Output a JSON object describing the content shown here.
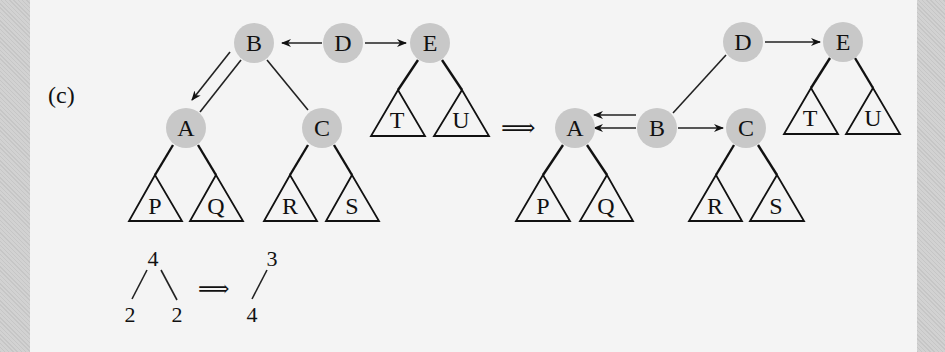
{
  "figure": {
    "panel_label": "(c)",
    "transform_arrow": "⟹",
    "before_tree": {
      "nodes": [
        {
          "id": "B",
          "label": "B"
        },
        {
          "id": "D",
          "label": "D"
        },
        {
          "id": "E",
          "label": "E"
        },
        {
          "id": "A",
          "label": "A"
        },
        {
          "id": "C",
          "label": "C"
        }
      ],
      "subtrees": [
        "P",
        "Q",
        "R",
        "S",
        "T",
        "U"
      ],
      "pointer_arrows": [
        {
          "from": "D",
          "to": "B"
        },
        {
          "from": "D",
          "to": "E"
        },
        {
          "from": "B",
          "to": "A"
        }
      ],
      "edges": [
        {
          "from": "B",
          "to": "A"
        },
        {
          "from": "B",
          "to": "C"
        },
        {
          "from": "A",
          "to": "P"
        },
        {
          "from": "A",
          "to": "Q"
        },
        {
          "from": "C",
          "to": "R"
        },
        {
          "from": "C",
          "to": "S"
        },
        {
          "from": "E",
          "to": "T"
        },
        {
          "from": "E",
          "to": "U"
        }
      ]
    },
    "after_tree": {
      "nodes": [
        {
          "id": "D",
          "label": "D"
        },
        {
          "id": "E",
          "label": "E"
        },
        {
          "id": "A",
          "label": "A"
        },
        {
          "id": "B",
          "label": "B"
        },
        {
          "id": "C",
          "label": "C"
        }
      ],
      "subtrees": [
        "P",
        "Q",
        "R",
        "S",
        "T",
        "U"
      ],
      "pointer_arrows": [
        {
          "from": "D",
          "to": "E"
        },
        {
          "from": "B",
          "to": "A"
        },
        {
          "from": "B",
          "to": "A"
        },
        {
          "from": "B",
          "to": "C"
        }
      ],
      "edges": [
        {
          "from": "D",
          "to": "B"
        },
        {
          "from": "A",
          "to": "P"
        },
        {
          "from": "A",
          "to": "Q"
        },
        {
          "from": "C",
          "to": "R"
        },
        {
          "from": "C",
          "to": "S"
        },
        {
          "from": "E",
          "to": "T"
        },
        {
          "from": "E",
          "to": "U"
        }
      ]
    },
    "rank_example": {
      "before": {
        "root": "4",
        "left": "2",
        "right": "2"
      },
      "arrow": "⟹",
      "after": {
        "root": "3",
        "left": "4"
      }
    }
  }
}
